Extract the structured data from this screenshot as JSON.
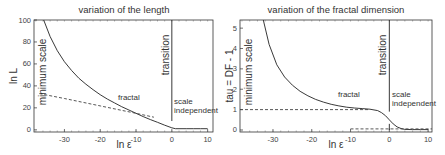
{
  "chart_data": [
    {
      "type": "line",
      "title": "variation of the length",
      "xlabel": "ln ε",
      "ylabel": "ln L",
      "xlim": [
        -38.5,
        11.5
      ],
      "ylim": [
        -2,
        100
      ],
      "xticks": [
        -30,
        -20,
        -10,
        0,
        10
      ],
      "yticks": [
        0,
        20,
        40,
        60,
        80,
        100
      ],
      "grid": false,
      "series": [
        {
          "name": "ln L (solid)",
          "style": "solid",
          "x": [
            -35.8,
            -34,
            -32,
            -30,
            -28,
            -26,
            -24,
            -22,
            -20,
            -18,
            -16,
            -14,
            -12,
            -10,
            -8,
            -6,
            -4,
            -2,
            0,
            1,
            2,
            4,
            6,
            8,
            10
          ],
          "y": [
            100,
            85,
            72,
            62,
            54,
            47,
            41.5,
            36.5,
            32,
            28,
            24.5,
            21,
            18,
            15,
            12,
            9.3,
            6.8,
            4.2,
            1.8,
            1,
            1,
            1,
            1,
            1,
            1
          ]
        },
        {
          "name": "asymptote (dashed)",
          "style": "dashed",
          "x": [
            -37,
            -30,
            -20,
            -10,
            -5
          ],
          "y": [
            33,
            28.5,
            21.8,
            15,
            11.5
          ]
        }
      ],
      "annotations": [
        {
          "text": "minimum scale",
          "rotated": true
        },
        {
          "text": "transition",
          "rotated": true
        },
        {
          "text": "fractal"
        },
        {
          "text": "scale"
        },
        {
          "text": "independent"
        }
      ],
      "vlines": [
        {
          "x": 0,
          "y_from": 8,
          "y_to": 100
        }
      ]
    },
    {
      "type": "line",
      "title": "variation of the fractal dimension",
      "xlabel": "ln ε",
      "ylabel": "tau = DF - 1",
      "xlim": [
        -38.5,
        11
      ],
      "ylim": [
        -0.1,
        5.4
      ],
      "xticks": [
        -30,
        -20,
        -10,
        0,
        10
      ],
      "yticks": [
        0,
        1,
        2,
        3,
        4,
        5
      ],
      "grid": false,
      "series": [
        {
          "name": "tau (solid)",
          "style": "solid",
          "x": [
            -32.5,
            -31,
            -29,
            -27,
            -25,
            -23,
            -21,
            -19,
            -17,
            -15,
            -13,
            -11,
            -9,
            -7,
            -5,
            -3,
            -2,
            -1,
            0,
            1,
            2,
            3,
            4,
            6,
            8,
            10
          ],
          "y": [
            5.4,
            4.2,
            3.2,
            2.6,
            2.2,
            1.9,
            1.68,
            1.5,
            1.37,
            1.26,
            1.18,
            1.12,
            1.08,
            1.05,
            1.02,
            0.95,
            0.85,
            0.7,
            0.5,
            0.3,
            0.15,
            0.07,
            0.03,
            0.02,
            0.02,
            0.02
          ]
        },
        {
          "name": "tau = 1 (dashed)",
          "style": "dashed",
          "x": [
            -38.5,
            -5
          ],
          "y": [
            1,
            1
          ]
        },
        {
          "name": "tau = 0 (dashed)",
          "style": "dashed",
          "x": [
            -10,
            11
          ],
          "y": [
            0.05,
            0.05
          ]
        }
      ],
      "annotations": [
        {
          "text": "minimum scale",
          "rotated": true
        },
        {
          "text": "transition",
          "rotated": true
        },
        {
          "text": "fractal"
        },
        {
          "text": "scale"
        },
        {
          "text": "independent"
        }
      ],
      "vlines": [
        {
          "x": 0,
          "y_from": 0.9,
          "y_to": 5.4
        },
        {
          "x": 0,
          "y_from": 0,
          "y_to": 0.3
        }
      ]
    }
  ]
}
